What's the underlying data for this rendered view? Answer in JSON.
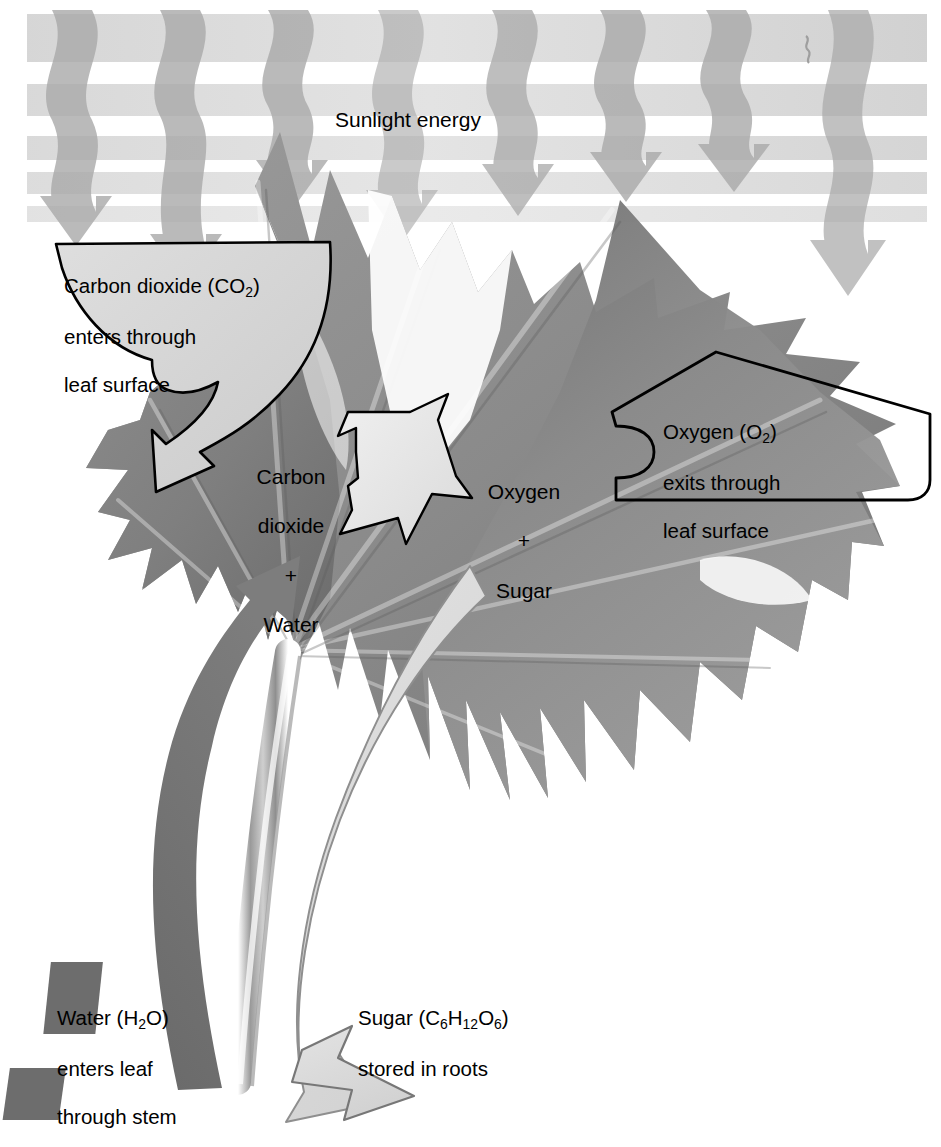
{
  "figure": {
    "type": "process-diagram",
    "subject": "leaf"
  },
  "sunlight": {
    "label": "Sunlight energy",
    "ray_count": 8,
    "band_count": 5,
    "ray_color": "#a8a8a8",
    "band_color": "#d2d2d2"
  },
  "callouts": {
    "co2": {
      "line1": "Carbon dioxide (CO",
      "sub1": "2",
      "line1_end": ")",
      "line2": "enters through",
      "line3": "leaf surface",
      "fill": "#d8d8d8",
      "stroke": "#000000",
      "direction": "down-right"
    },
    "o2": {
      "line1": "Oxygen (O",
      "sub1": "2",
      "line1_end": ")",
      "line2": "exits through",
      "line3": "leaf surface",
      "fill": "none",
      "stroke": "#000000",
      "direction": "left"
    }
  },
  "equation": {
    "reactants": [
      "Carbon",
      "dioxide",
      "+",
      "Water"
    ],
    "plus": "+",
    "products": [
      "Oxygen",
      "+",
      "Sugar"
    ],
    "arrow_fill": "#e8e8e8",
    "arrow_stroke": "#000000",
    "arrow_direction": "right"
  },
  "bottom_labels": {
    "water": {
      "line1_a": "Water (H",
      "sub": "2",
      "line1_b": "O)",
      "line2": "enters leaf",
      "line3": "through stem"
    },
    "sugar": {
      "line1_a": "Sugar (C",
      "sub1": "6",
      "line1_b": "H",
      "sub2": "12",
      "line1_c": "O",
      "sub3": "6",
      "line1_d": ")",
      "line2": "stored in roots"
    }
  },
  "flow_arrows": {
    "water": {
      "name": "water-uptake-arrow",
      "color": "#6e6e6e",
      "direction": "up-left-curve",
      "description": "dark curved arrow from stem up into leaf"
    },
    "sugar": {
      "name": "sugar-transport-arrow",
      "color": "#dcdcdc",
      "direction": "down-right-curve",
      "description": "light curved arrow from leaf down to roots"
    }
  },
  "colors": {
    "leaf_base": "#8e8e8e",
    "leaf_dark": "#6f6f6f",
    "leaf_light": "#a5a5a5",
    "background": "#ffffff",
    "outline": "#000000"
  }
}
